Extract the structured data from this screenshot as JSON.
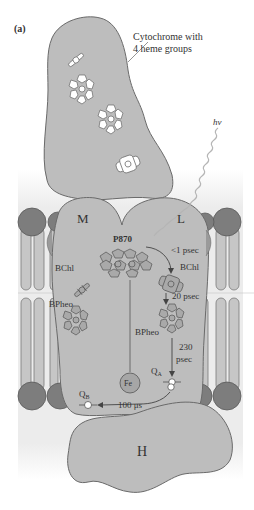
{
  "figure": {
    "panel_label": "(a)",
    "top_cut_text": "",
    "colors": {
      "protein_fill": "#bdbdbd",
      "protein_stroke": "#6a6a6a",
      "lipid_head": "#7d7d7d",
      "lipid_tail": "#c6c6c6",
      "membrane_band": "#e6e6e6",
      "text": "#333333"
    }
  },
  "labels": {
    "cytochrome": [
      "Cytochrome with",
      "4 heme groups"
    ],
    "photon": "hν",
    "subunit_m": "M",
    "subunit_l": "L",
    "subunit_h": "H",
    "p870": "P870",
    "bchl_left": "BChl",
    "bchl_right": "BChl",
    "bpheo_left": "BPheo",
    "bpheo_right": "BPheo",
    "time_1": "<1 psec",
    "time_2": "20 psec",
    "time_3a": "230",
    "time_3b": "psec",
    "time_4": "100 μs",
    "qa": "Q",
    "qa_sub": "A",
    "qb": "Q",
    "qb_sub": "B",
    "fe": "Fe"
  }
}
